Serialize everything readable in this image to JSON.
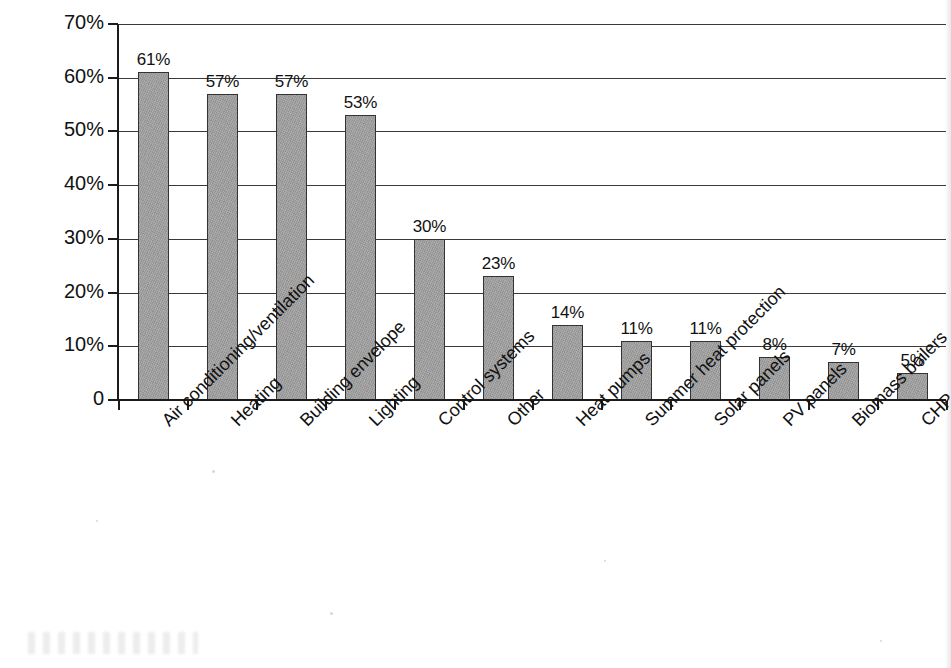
{
  "chart_data": {
    "type": "bar",
    "title": "",
    "subtitle": "",
    "xlabel": "",
    "ylabel": "",
    "ylim": [
      0,
      70
    ],
    "grid": true,
    "legend": "none",
    "orientation": "vertical",
    "value_suffix": "%",
    "categories": [
      "Air conditioning/ventilation",
      "Heating",
      "Building envelope",
      "Lighting",
      "Control systems",
      "Other",
      "Heat pumps",
      "Summer heat protection",
      "Solar panels",
      "PV panels",
      "Biomass boilers",
      "CHP"
    ],
    "values": [
      61,
      57,
      57,
      53,
      30,
      23,
      14,
      11,
      11,
      8,
      7,
      5
    ],
    "data_labels": [
      "61%",
      "57%",
      "57%",
      "53%",
      "30%",
      "23%",
      "14%",
      "11%",
      "11%",
      "8%",
      "7%",
      "5%"
    ],
    "ytick_values": [
      0,
      10,
      20,
      30,
      40,
      50,
      60,
      70
    ],
    "ytick_labels": [
      "0",
      "10%",
      "20%",
      "30%",
      "40%",
      "50%",
      "60%",
      "70%"
    ],
    "colors": {
      "bar_fill": "#9d9d9d",
      "bar_border": "#333333",
      "gridline": "#3a3a3a",
      "axis": "#1b1b1b",
      "text": "#111111",
      "background": "#ffffff"
    }
  }
}
